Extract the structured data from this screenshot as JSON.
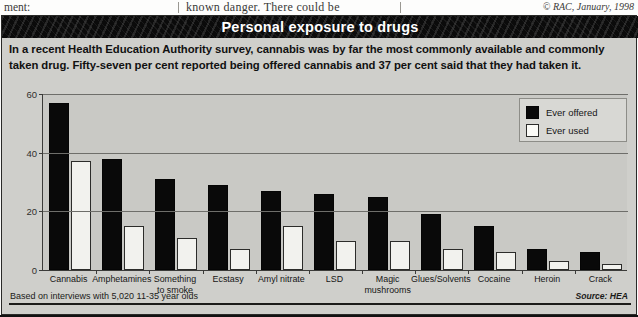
{
  "page_top": {
    "left_text": "ment:",
    "middle_text": "known danger. There could be",
    "copyright": "© RAC, January, 1998"
  },
  "figure": {
    "title": "Personal exposure to drugs",
    "intro": "In a recent Health Education Authority survey, cannabis was by far the most commonly available and commonly taken drug. Fifty-seven per cent reported being offered cannabis and 37 per cent said that they had taken it.",
    "footnote": "Based on interviews with 5,020 11-35 year olds",
    "source": "Source: HEA",
    "colors": {
      "title_bar": "#0b0b0b",
      "title_text": "#ffffff",
      "panel": "#cfcfcb",
      "plot_background": "#c9c9c5",
      "offered_bar": "#090909",
      "used_bar": "#f2f2ee",
      "axis": "#3b3b39"
    }
  },
  "legend": {
    "position": "top-right",
    "entries": [
      {
        "label": "Ever offered",
        "swatch": "black"
      },
      {
        "label": "Ever used",
        "swatch": "white"
      }
    ]
  },
  "chart_data": {
    "type": "bar",
    "title": "Personal exposure to drugs",
    "xlabel": "",
    "ylabel": "",
    "ylim": [
      0,
      60
    ],
    "yticks": [
      0,
      20,
      40,
      60
    ],
    "grid": true,
    "legend_position": "top-right",
    "categories": [
      "Cannabis",
      "Amphetamines",
      "Something to smoke",
      "Ecstasy",
      "Amyl nitrate",
      "LSD",
      "Magic mushrooms",
      "Glues/Solvents",
      "Cocaine",
      "Heroin",
      "Crack"
    ],
    "series": [
      {
        "name": "Ever offered",
        "values": [
          57,
          38,
          31,
          29,
          27,
          26,
          25,
          19,
          15,
          7,
          6
        ]
      },
      {
        "name": "Ever used",
        "values": [
          37,
          15,
          11,
          7,
          15,
          10,
          10,
          7,
          6,
          3,
          2
        ]
      }
    ],
    "annotations": [
      "Based on interviews with 5,020 11-35 year olds",
      "Source: HEA"
    ]
  }
}
